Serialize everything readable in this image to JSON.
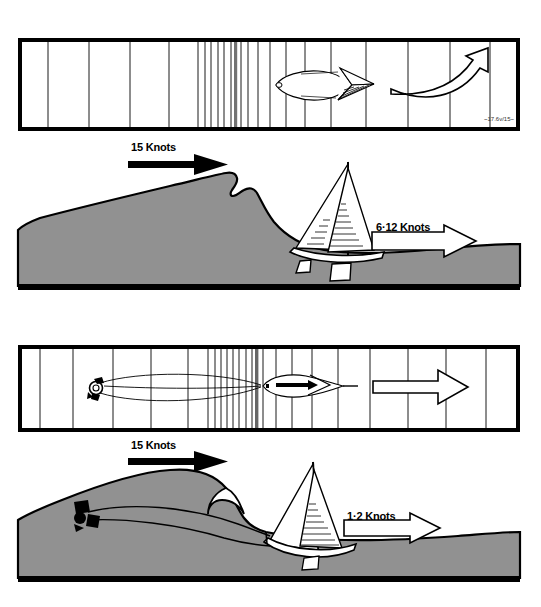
{
  "figure": {
    "background_color": "#ffffff",
    "sea_color": "#919191",
    "ink_color": "#000000"
  },
  "panels": [
    {
      "id": "top-plan-view",
      "kind": "plan-view",
      "caption": "Plan view: boat running free before breaking wave crests",
      "wave_lines_label": "wave-crest-lines",
      "signature": "~17.6v/15~",
      "arrow": {
        "name": "curved-sweep-arrow",
        "style": "outline",
        "direction": "right-and-up"
      }
    },
    {
      "id": "top-wave-scene",
      "kind": "section-view",
      "caption": "Section view: boat surfing down face of breaking wave",
      "wind_label": "15 Knots",
      "wind_arrow_style": "solid",
      "boat_speed_label": "6·12 Knots",
      "boat_speed_arrow_style": "outline"
    },
    {
      "id": "bottom-plan-view",
      "kind": "plan-view",
      "caption": "Plan view: boat streaming a drogue astern",
      "wave_lines_label": "wave-crest-lines",
      "drogue_label": "drogue",
      "warp_label": "warp-line",
      "arrow": {
        "name": "straight-arrow",
        "style": "outline",
        "direction": "right"
      }
    },
    {
      "id": "bottom-wave-scene",
      "kind": "section-view",
      "caption": "Section view: drogue holds boat back on wave face",
      "wind_label": "15 Knots",
      "wind_arrow_style": "solid",
      "boat_speed_label": "1·2  Knots",
      "boat_speed_arrow_style": "outline",
      "drogue_label": "drogue"
    }
  ],
  "labels": {
    "wind_top": "15 Knots",
    "speed_top": "6·12 Knots",
    "wind_bottom": "15 Knots",
    "speed_bottom": "1·2  Knots",
    "signature": "~17.6v/15~"
  }
}
